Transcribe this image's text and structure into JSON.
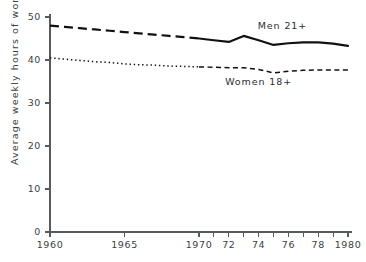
{
  "chart_data": {
    "type": "line",
    "title": "",
    "xlabel": "",
    "ylabel": "Average weekly hours of work",
    "xlim": [
      1960,
      1980
    ],
    "ylim": [
      0,
      50
    ],
    "grid": false,
    "legend_position": "inline-annotation",
    "y_ticks": [
      0,
      10,
      20,
      30,
      40,
      50
    ],
    "y_tick_labels": [
      "0",
      "10",
      "20",
      "30",
      "40",
      "50"
    ],
    "x_ticks": [
      1960,
      1965,
      1970,
      1971,
      1972,
      1973,
      1974,
      1975,
      1976,
      1977,
      1978,
      1979,
      1980
    ],
    "x_tick_labels": [
      "1960",
      "1965",
      "1970",
      "",
      "72",
      "",
      "74",
      "",
      "76",
      "",
      "78",
      "",
      "1980"
    ],
    "x": [
      1960,
      1961,
      1962,
      1963,
      1964,
      1965,
      1966,
      1967,
      1968,
      1969,
      1970,
      1971,
      1972,
      1973,
      1974,
      1975,
      1976,
      1977,
      1978,
      1979,
      1980
    ],
    "series": [
      {
        "name": "Men 21+",
        "label": "Men 21+",
        "style": "dashed-then-solid",
        "style_break_year": 1970,
        "color": "#111111",
        "values": [
          48.0,
          47.7,
          47.4,
          47.1,
          46.8,
          46.5,
          46.2,
          45.9,
          45.6,
          45.3,
          45.0,
          44.6,
          44.2,
          45.6,
          44.6,
          43.5,
          43.9,
          44.1,
          44.1,
          43.8,
          43.3
        ]
      },
      {
        "name": "Women 18+",
        "label": "Women 18+",
        "style": "dotted-then-dashed",
        "style_break_year": 1970,
        "color": "#111111",
        "values": [
          40.5,
          40.2,
          39.9,
          39.6,
          39.4,
          39.1,
          38.9,
          38.8,
          38.6,
          38.5,
          38.4,
          38.3,
          38.2,
          38.2,
          37.8,
          37.0,
          37.4,
          37.6,
          37.7,
          37.7,
          37.7
        ]
      }
    ],
    "annotations": [
      {
        "text": "Men 21+",
        "x": 1975.6,
        "y": 47.2
      },
      {
        "text": "Women 18+",
        "x": 1974.0,
        "y": 34.2
      }
    ]
  }
}
